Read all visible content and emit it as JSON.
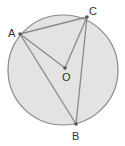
{
  "diagram": {
    "colors": {
      "fill": "#e3e3e3",
      "stroke": "#8a8a8a",
      "point": "#555555",
      "text": "#333333"
    },
    "circle": {
      "cx": 63,
      "cy": 70,
      "r": 55
    },
    "points": {
      "A": {
        "label": "A",
        "x": 20,
        "y": 34
      },
      "C": {
        "label": "C",
        "x": 87,
        "y": 17
      },
      "O": {
        "label": "O",
        "x": 65,
        "y": 68
      },
      "B": {
        "label": "B",
        "x": 76,
        "y": 124
      }
    },
    "segments": [
      "AC",
      "AO",
      "CO",
      "AB",
      "CB"
    ]
  }
}
